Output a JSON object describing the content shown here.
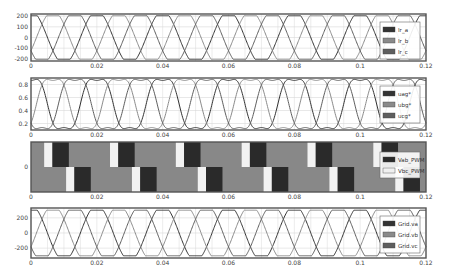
{
  "chart_data": [
    {
      "type": "line",
      "title": "",
      "xlabel": "",
      "ylabel": "",
      "xlim": [
        0,
        0.12
      ],
      "ylim": [
        -220,
        220
      ],
      "x_ticks": [
        "0",
        "0.02",
        "0.04",
        "0.06",
        "0.08",
        "0.1",
        "0.12"
      ],
      "y_ticks": [
        "200",
        "100",
        "0",
        "-100",
        "-200"
      ],
      "grid": true,
      "legend_position": "right-inside",
      "series": [
        {
          "name": "Ir_a",
          "color": "#333333",
          "waveform": "clipped-sine",
          "amplitude": 210,
          "frequency_hz": 50,
          "phase_deg": 0
        },
        {
          "name": "Ir_b",
          "color": "#8a8a8a",
          "waveform": "clipped-sine",
          "amplitude": 210,
          "frequency_hz": 50,
          "phase_deg": -120
        },
        {
          "name": "Ir_c",
          "color": "#5e5e5e",
          "waveform": "clipped-sine",
          "amplitude": 210,
          "frequency_hz": 50,
          "phase_deg": 120
        }
      ]
    },
    {
      "type": "line",
      "title": "",
      "xlabel": "",
      "ylabel": "",
      "xlim": [
        0,
        0.12
      ],
      "ylim": [
        0.1,
        0.9
      ],
      "x_ticks": [
        "0",
        "0.02",
        "0.04",
        "0.06",
        "0.08",
        "0.1",
        "0.12"
      ],
      "y_ticks": [
        "0.8",
        "0.6",
        "0.4",
        "0.2"
      ],
      "grid": true,
      "legend_position": "right-inside",
      "series": [
        {
          "name": "uag*",
          "color": "#333333",
          "waveform": "third-harmonic-injected sine",
          "offset": 0.5,
          "amplitude": 0.38,
          "frequency_hz": 50,
          "phase_deg": 0
        },
        {
          "name": "ubg*",
          "color": "#8a8a8a",
          "waveform": "third-harmonic-injected sine",
          "offset": 0.5,
          "amplitude": 0.38,
          "frequency_hz": 50,
          "phase_deg": -120
        },
        {
          "name": "ucg*",
          "color": "#5e5e5e",
          "waveform": "third-harmonic-injected sine",
          "offset": 0.5,
          "amplitude": 0.38,
          "frequency_hz": 50,
          "phase_deg": 120
        }
      ]
    },
    {
      "type": "area",
      "title": "",
      "xlabel": "",
      "ylabel": "",
      "xlim": [
        0,
        0.12
      ],
      "x_ticks": [
        "0",
        "0.02",
        "0.04",
        "0.06",
        "0.08",
        "0.1",
        "0.12"
      ],
      "y_ticks": [
        "0"
      ],
      "grid": false,
      "legend_position": "right-inside",
      "series": [
        {
          "name": "Vab_PWM",
          "color": "#2a2a2a",
          "waveform": "square",
          "frequency_hz": 50
        },
        {
          "name": "Vbc_PWM",
          "color": "#f0f0f0",
          "waveform": "square",
          "frequency_hz": 50,
          "phase_deg": -120
        }
      ]
    },
    {
      "type": "line",
      "title": "",
      "xlabel": "",
      "ylabel": "",
      "xlim": [
        0,
        0.12
      ],
      "ylim": [
        -330,
        330
      ],
      "x_ticks": [
        "0",
        "0.02",
        "0.04",
        "0.06",
        "0.08",
        "0.1",
        "0.12"
      ],
      "y_ticks": [
        "200",
        "0",
        "-200"
      ],
      "grid": true,
      "legend_position": "right-inside",
      "series": [
        {
          "name": "Grid.va",
          "color": "#333333",
          "waveform": "clipped-sine",
          "amplitude": 310,
          "frequency_hz": 50,
          "phase_deg": 0
        },
        {
          "name": "Grid.vb",
          "color": "#8a8a8a",
          "waveform": "clipped-sine",
          "amplitude": 310,
          "frequency_hz": 50,
          "phase_deg": -120
        },
        {
          "name": "Grid.vc",
          "color": "#5e5e5e",
          "waveform": "clipped-sine",
          "amplitude": 310,
          "frequency_hz": 50,
          "phase_deg": 120
        }
      ]
    }
  ],
  "colors": {
    "frame": "#555555",
    "grid": "#d8d8d8",
    "pwm_mid": "#888888",
    "pwm_dark": "#2a2a2a",
    "pwm_light": "#f2f2f2"
  }
}
